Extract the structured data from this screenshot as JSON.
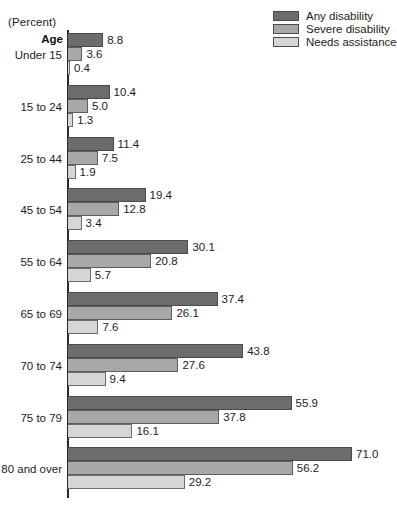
{
  "header": {
    "percent_note": "(Percent)",
    "age_label": "Age"
  },
  "legend": {
    "items": [
      {
        "label": "Any disability",
        "color": "#6c6c6c",
        "key": "any"
      },
      {
        "label": "Severe disability",
        "color": "#a8a8a8",
        "key": "severe"
      },
      {
        "label": "Needs assistance",
        "color": "#d6d6d6",
        "key": "needs"
      }
    ]
  },
  "chart_data": {
    "type": "bar",
    "orientation": "horizontal",
    "title": "",
    "subtitle": "",
    "xlabel": "(Percent)",
    "ylabel": "Age",
    "grid": false,
    "legend_position": "top-right",
    "xlim": [
      0,
      75
    ],
    "categories": [
      "Under 15",
      "15 to 24",
      "25 to 44",
      "45 to 54",
      "55 to 64",
      "65 to 69",
      "70 to 74",
      "75 to 79",
      "80 and over"
    ],
    "series": [
      {
        "name": "Any disability",
        "color": "#6c6c6c",
        "values": [
          8.8,
          10.4,
          11.4,
          19.4,
          30.1,
          37.4,
          43.8,
          55.9,
          71.0
        ],
        "labels": [
          "8.8",
          "10.4",
          "11.4",
          "19.4",
          "30.1",
          "37.4",
          "43.8",
          "55.9",
          "71.0"
        ]
      },
      {
        "name": "Severe disability",
        "color": "#a8a8a8",
        "values": [
          3.6,
          5.0,
          7.5,
          12.8,
          20.8,
          26.1,
          27.6,
          37.8,
          56.2
        ],
        "labels": [
          "3.6",
          "5.0",
          "7.5",
          "12.8",
          "20.8",
          "26.1",
          "27.6",
          "37.8",
          "56.2"
        ]
      },
      {
        "name": "Needs assistance",
        "color": "#d6d6d6",
        "values": [
          0.4,
          1.3,
          1.9,
          3.4,
          5.7,
          7.6,
          9.4,
          16.1,
          29.2
        ],
        "labels": [
          "0.4",
          "1.3",
          "1.9",
          "3.4",
          "5.7",
          "7.6",
          "9.4",
          "16.1",
          "29.2"
        ]
      }
    ]
  }
}
